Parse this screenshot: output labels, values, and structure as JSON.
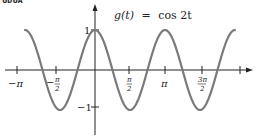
{
  "cropped_header_fragment": "ᴜᴅᴜᴀ",
  "chart_data": {
    "type": "line",
    "title": "g(t) = cos 2t",
    "xlabel": "",
    "ylabel": "",
    "function": "cos(2t)",
    "xlim": [
      -3.1416,
      6.2832
    ],
    "ylim": [
      -1,
      1
    ],
    "grid": false,
    "legend": null,
    "x_ticks": [
      {
        "value": -3.1416,
        "label": "−π"
      },
      {
        "value": -1.5708,
        "label": "−π/2"
      },
      {
        "value": 1.5708,
        "label": "π/2"
      },
      {
        "value": 3.1416,
        "label": "π"
      },
      {
        "value": 4.7124,
        "label": "3π/2"
      },
      {
        "value": 6.2832,
        "label": ""
      }
    ],
    "y_ticks": [
      {
        "value": 1,
        "label": "1"
      },
      {
        "value": -1,
        "label": "−1"
      }
    ],
    "series": [
      {
        "name": "g(t)",
        "x": [
          -3.1416,
          -2.3562,
          -1.5708,
          -0.7854,
          0,
          0.7854,
          1.5708,
          2.3562,
          3.1416,
          3.927,
          4.7124,
          5.4978,
          6.2832
        ],
        "values": [
          1,
          0,
          -1,
          0,
          1,
          0,
          -1,
          0,
          1,
          0,
          -1,
          0,
          1
        ]
      }
    ],
    "colors": {
      "curve": "#7a7a7a",
      "axes": "#222222"
    }
  },
  "labels": {
    "title_func": "g(t)",
    "title_eq": "=",
    "title_rhs": "cos 2t",
    "y_pos_1": "1",
    "y_neg_1": "−1",
    "x_neg_pi": "−π",
    "x_neg_pi_half_num": "π",
    "x_neg_pi_half_den": "2",
    "x_neg_sign": "−",
    "x_pi_half_num": "π",
    "x_pi_half_den": "2",
    "x_pi": "π",
    "x_3pi_half_num": "3π",
    "x_3pi_half_den": "2"
  }
}
